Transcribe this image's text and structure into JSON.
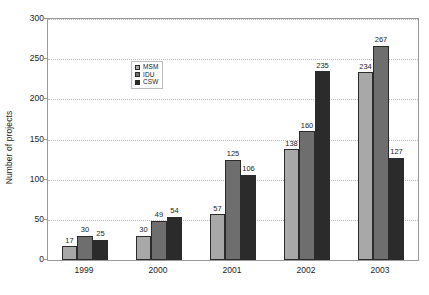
{
  "chart_data": {
    "type": "bar",
    "title": "",
    "xlabel": "",
    "ylabel": "Number of projects",
    "categories": [
      "1999",
      "2000",
      "2001",
      "2002",
      "2003"
    ],
    "series": [
      {
        "name": "MSM",
        "color": "#a8a8a8",
        "values": [
          17,
          30,
          57,
          138,
          234
        ]
      },
      {
        "name": "IDU",
        "color": "#6e6e6e",
        "values": [
          30,
          49,
          125,
          160,
          267
        ]
      },
      {
        "name": "CSW",
        "color": "#2b2b2b",
        "values": [
          25,
          54,
          106,
          235,
          127
        ]
      }
    ],
    "ylim": [
      0,
      300
    ],
    "yticks": [
      0,
      50,
      100,
      150,
      200,
      250,
      300
    ],
    "ytick_labels": [
      "0",
      "50",
      "100",
      "150",
      "200",
      "250",
      "300"
    ],
    "grid": true,
    "grid_axis": "y",
    "legend_position": "upper-center-left",
    "data_labels": true,
    "colors": {
      "axis": "#9a9a9a",
      "grid": "#b9b9b9",
      "text": "#1d1d1d",
      "background": "#ffffff",
      "bar_outline": "#2b2b2b"
    }
  }
}
